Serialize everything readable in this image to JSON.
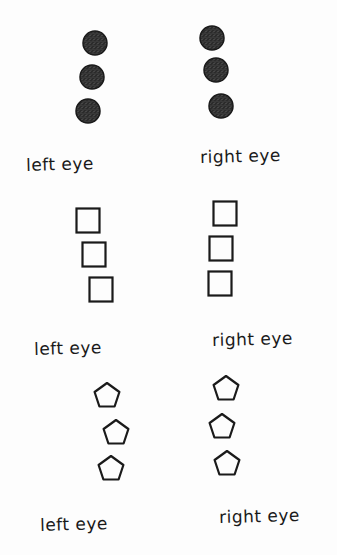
{
  "panels": [
    {
      "shape": "filled-circle",
      "left_label": "left eye",
      "right_label": "right eye",
      "left_shapes": [
        [
          95,
          43
        ],
        [
          92,
          77
        ],
        [
          88,
          111
        ]
      ],
      "right_shapes": [
        [
          212,
          38
        ],
        [
          216,
          70
        ],
        [
          221,
          106
        ]
      ],
      "left_label_pos": [
        26,
        154
      ],
      "right_label_pos": [
        200,
        146
      ]
    },
    {
      "shape": "square",
      "left_label": "left eye",
      "right_label": "right eye",
      "left_shapes": [
        [
          88,
          221
        ],
        [
          94,
          255
        ],
        [
          101,
          290
        ]
      ],
      "right_shapes": [
        [
          225,
          214
        ],
        [
          221,
          249
        ],
        [
          220,
          284
        ]
      ],
      "left_label_pos": [
        34,
        338
      ],
      "right_label_pos": [
        212,
        329
      ]
    },
    {
      "shape": "pentagon",
      "left_label": "left eye",
      "right_label": "right eye",
      "left_shapes": [
        [
          107,
          396
        ],
        [
          116,
          433
        ],
        [
          111,
          469
        ]
      ],
      "right_shapes": [
        [
          226,
          389
        ],
        [
          222,
          427
        ],
        [
          227,
          464
        ]
      ],
      "left_label_pos": [
        40,
        514
      ],
      "right_label_pos": [
        219,
        506
      ]
    }
  ],
  "colors": {
    "ink": "#1a1a1a",
    "fill": "#2b2b2b"
  }
}
